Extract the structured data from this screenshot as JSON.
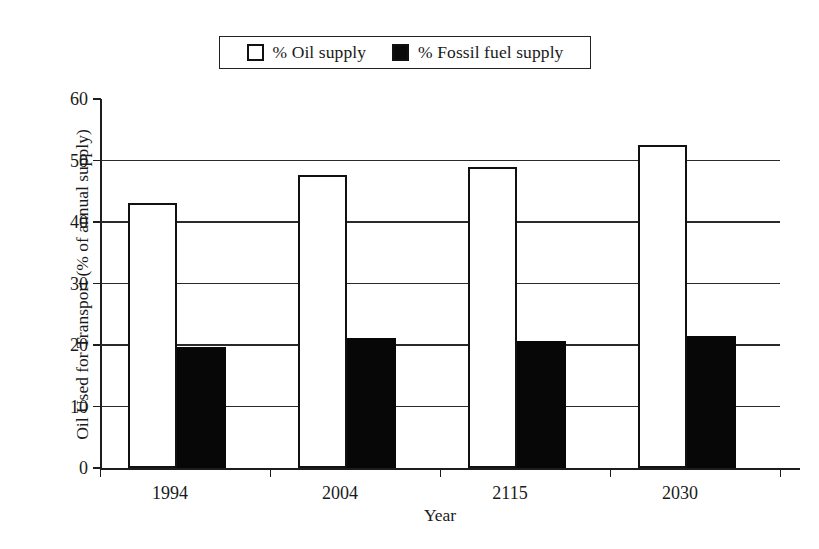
{
  "chart_data": {
    "type": "bar",
    "title": "",
    "xlabel": "Year",
    "ylabel": "Oil Used for Transport (% of annual supply)",
    "categories": [
      "1994",
      "2004",
      "2115",
      "2030"
    ],
    "series": [
      {
        "name": "% Oil supply",
        "color": "#ffffff",
        "edge_color": "#111111",
        "values": [
          43.1,
          47.7,
          48.9,
          52.5
        ]
      },
      {
        "name": "% Fossil fuel supply",
        "color": "#070707",
        "edge_color": "#070707",
        "values": [
          19.7,
          21.2,
          20.7,
          21.5
        ]
      }
    ],
    "ylim": [
      0,
      60
    ],
    "yticks": [
      0,
      10,
      20,
      30,
      40,
      50,
      60
    ],
    "ytick_labels": [
      "0",
      "10",
      "20",
      "30",
      "40",
      "50",
      "60"
    ],
    "grid": true,
    "grid_axis": "y",
    "legend_position": "top-center",
    "legend_frame": true
  },
  "legend": {
    "entries": [
      {
        "label": "% Oil supply",
        "swatch": "hollow-square"
      },
      {
        "label": "% Fossil fuel supply",
        "swatch": "filled-square"
      }
    ]
  },
  "axes": {
    "y_title": "Oil Used for Transport (% of annual supply)",
    "x_title": "Year"
  }
}
